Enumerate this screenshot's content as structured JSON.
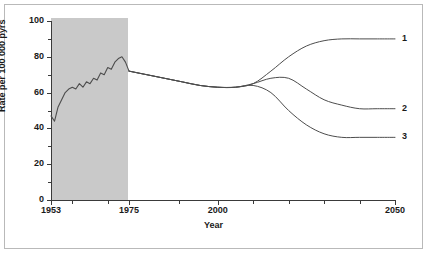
{
  "chart_data": {
    "type": "line",
    "title": "",
    "xlabel": "Year",
    "ylabel": "Rate per 100 000 pyrs",
    "xlim": [
      1953,
      2050
    ],
    "ylim": [
      0,
      100
    ],
    "grid": false,
    "legend_position": "right-inline",
    "y_ticks": [
      {
        "value": 100,
        "label": "100",
        "major": true
      },
      {
        "value": 90,
        "label": "",
        "major": false
      },
      {
        "value": 80,
        "label": "80",
        "major": true
      },
      {
        "value": 70,
        "label": "",
        "major": false
      },
      {
        "value": 60,
        "label": "60",
        "major": true
      },
      {
        "value": 50,
        "label": "",
        "major": false
      },
      {
        "value": 40,
        "label": "40",
        "major": true
      },
      {
        "value": 30,
        "label": "",
        "major": false
      },
      {
        "value": 20,
        "label": "20",
        "major": true
      },
      {
        "value": 10,
        "label": "",
        "major": false
      },
      {
        "value": 0,
        "label": "0",
        "major": true
      }
    ],
    "x_ticks": [
      {
        "value": 1953,
        "label": "1953",
        "major": true
      },
      {
        "value": 1959,
        "label": "",
        "major": false
      },
      {
        "value": 1969,
        "label": "",
        "major": false
      },
      {
        "value": 1975,
        "label": "1975",
        "major": true
      },
      {
        "value": 1989,
        "label": "",
        "major": false
      },
      {
        "value": 2000,
        "label": "2000",
        "major": true
      },
      {
        "value": 2010,
        "label": "",
        "major": false
      },
      {
        "value": 2020,
        "label": "",
        "major": false
      },
      {
        "value": 2030,
        "label": "",
        "major": false
      },
      {
        "value": 2040,
        "label": "",
        "major": false
      },
      {
        "value": 2050,
        "label": "2050",
        "major": true
      }
    ],
    "shaded_region": {
      "x_start": 1953,
      "x_end": 1975,
      "y_start": 0,
      "y_end": 100,
      "color": "#c9c9c9",
      "description": "observed-period shading"
    },
    "line_color": "#4d4d4d",
    "series": [
      {
        "name": "observed",
        "label": "",
        "x": [
          1953,
          1954,
          1955,
          1956,
          1957,
          1958,
          1959,
          1960,
          1961,
          1962,
          1963,
          1964,
          1965,
          1966,
          1967,
          1968,
          1969,
          1970,
          1971,
          1972,
          1973,
          1974,
          1975
        ],
        "values": [
          47,
          44,
          52,
          56,
          60,
          62,
          63,
          62,
          65,
          63,
          66,
          65,
          68,
          67,
          71,
          70,
          74,
          73,
          77,
          79,
          80,
          77,
          72
        ]
      },
      {
        "name": "projection-1",
        "label": "1",
        "x": [
          1975,
          1980,
          1985,
          1990,
          1995,
          2000,
          2005,
          2010,
          2015,
          2020,
          2025,
          2030,
          2035,
          2040,
          2045,
          2050
        ],
        "values": [
          72,
          70,
          68,
          66,
          64,
          63,
          63,
          65,
          72,
          80,
          86,
          89,
          90,
          90,
          90,
          90
        ]
      },
      {
        "name": "projection-2",
        "label": "2",
        "x": [
          1975,
          1980,
          1985,
          1990,
          1995,
          2000,
          2005,
          2010,
          2015,
          2020,
          2025,
          2030,
          2035,
          2040,
          2045,
          2050
        ],
        "values": [
          72,
          70,
          68,
          66,
          64,
          63,
          63,
          65,
          68,
          68,
          62,
          56,
          53,
          51,
          51,
          51
        ]
      },
      {
        "name": "projection-3",
        "label": "3",
        "x": [
          1975,
          1980,
          1985,
          1990,
          1995,
          2000,
          2005,
          2010,
          2015,
          2020,
          2025,
          2030,
          2035,
          2040,
          2045,
          2050
        ],
        "values": [
          72,
          70,
          68,
          66,
          64,
          63,
          63,
          64,
          60,
          50,
          42,
          37,
          35,
          35,
          35,
          35
        ]
      }
    ],
    "series_labels": [
      {
        "label": "1",
        "value": 90
      },
      {
        "label": "2",
        "value": 51
      },
      {
        "label": "3",
        "value": 35
      }
    ]
  }
}
